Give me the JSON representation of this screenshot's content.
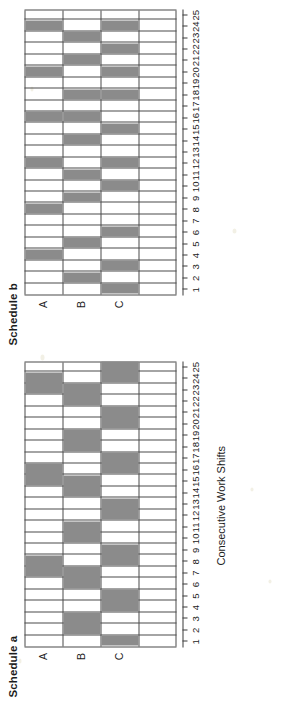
{
  "figure": {
    "axis_title": "Consecutive Work Shifts",
    "row_labels": [
      "A",
      "B",
      "C"
    ],
    "tick_labels": [
      "1",
      "2",
      "3",
      "4",
      "5",
      "6",
      "7",
      "8",
      "9",
      "10",
      "11",
      "12",
      "13",
      "14",
      "15",
      "16",
      "17",
      "18",
      "19",
      "20",
      "21",
      "22",
      "23",
      "24",
      "25"
    ],
    "fill_color": "#8b8b8b",
    "line_color": "#4a4a4a",
    "background_color": "#ffffff"
  },
  "panels": [
    {
      "id": "a",
      "title": "Schedule a"
    },
    {
      "id": "b",
      "title": "Schedule b"
    }
  ],
  "chart_data": {
    "type": "heatmap",
    "title": "",
    "xlabel": "Consecutive Work Shifts",
    "ylabel": "",
    "xlim": [
      0.5,
      25.5
    ],
    "grid": true,
    "legend": "none",
    "charts": [
      {
        "name": "Schedule a",
        "description": "Crew assignment grid: shaded block means the crew works that shift. Blocks are 2 shifts long.",
        "rows": [
          "A",
          "B",
          "C"
        ],
        "categories": [
          "1",
          "2",
          "3",
          "4",
          "5",
          "6",
          "7",
          "8",
          "9",
          "10",
          "11",
          "12",
          "13",
          "14",
          "15",
          "16",
          "17",
          "18",
          "19",
          "20",
          "21",
          "22",
          "23",
          "24",
          "25"
        ],
        "blocks": [
          {
            "row": "C",
            "start": 1,
            "end": 2
          },
          {
            "row": "B",
            "start": 2,
            "end": 4
          },
          {
            "row": "C",
            "start": 4,
            "end": 6
          },
          {
            "row": "B",
            "start": 6,
            "end": 8
          },
          {
            "row": "A",
            "start": 7,
            "end": 9
          },
          {
            "row": "C",
            "start": 8,
            "end": 10
          },
          {
            "row": "B",
            "start": 10,
            "end": 12
          },
          {
            "row": "C",
            "start": 12,
            "end": 14
          },
          {
            "row": "B",
            "start": 14,
            "end": 16
          },
          {
            "row": "A",
            "start": 15,
            "end": 17
          },
          {
            "row": "C",
            "start": 16,
            "end": 18
          },
          {
            "row": "B",
            "start": 18,
            "end": 20
          },
          {
            "row": "C",
            "start": 20,
            "end": 22
          },
          {
            "row": "B",
            "start": 22,
            "end": 24
          },
          {
            "row": "A",
            "start": 23,
            "end": 25
          },
          {
            "row": "C",
            "start": 24,
            "end": 26
          }
        ],
        "series": [
          {
            "name": "A",
            "values": [
              0,
              0,
              0,
              0,
              0,
              0,
              1,
              1,
              0,
              0,
              0,
              0,
              0,
              0,
              1,
              1,
              0,
              0,
              0,
              0,
              0,
              0,
              1,
              1,
              0
            ]
          },
          {
            "name": "B",
            "values": [
              0,
              1,
              1,
              0,
              0,
              1,
              1,
              0,
              0,
              1,
              1,
              0,
              0,
              1,
              1,
              0,
              0,
              1,
              1,
              0,
              0,
              1,
              1,
              0,
              0
            ]
          },
          {
            "name": "C",
            "values": [
              1,
              0,
              0,
              1,
              1,
              0,
              0,
              1,
              1,
              0,
              0,
              1,
              1,
              0,
              0,
              1,
              1,
              0,
              0,
              1,
              1,
              0,
              0,
              1,
              1
            ]
          }
        ]
      },
      {
        "name": "Schedule b",
        "description": "Crew assignment grid: shaded block means the crew works that shift. Blocks are 1 shift long.",
        "rows": [
          "A",
          "B",
          "C"
        ],
        "categories": [
          "1",
          "2",
          "3",
          "4",
          "5",
          "6",
          "7",
          "8",
          "9",
          "10",
          "11",
          "12",
          "13",
          "14",
          "15",
          "16",
          "17",
          "18",
          "19",
          "20",
          "21",
          "22",
          "23",
          "24",
          "25"
        ],
        "blocks": [
          {
            "row": "C",
            "start": 1,
            "end": 2
          },
          {
            "row": "B",
            "start": 2,
            "end": 3
          },
          {
            "row": "C",
            "start": 3,
            "end": 4
          },
          {
            "row": "A",
            "start": 4,
            "end": 5
          },
          {
            "row": "B",
            "start": 5,
            "end": 6
          },
          {
            "row": "C",
            "start": 6,
            "end": 7
          },
          {
            "row": "A",
            "start": 8,
            "end": 9
          },
          {
            "row": "B",
            "start": 9,
            "end": 10
          },
          {
            "row": "C",
            "start": 10,
            "end": 11
          },
          {
            "row": "B",
            "start": 11,
            "end": 12
          },
          {
            "row": "C",
            "start": 12,
            "end": 13
          },
          {
            "row": "A",
            "start": 12,
            "end": 13
          },
          {
            "row": "B",
            "start": 14,
            "end": 15
          },
          {
            "row": "C",
            "start": 15,
            "end": 16
          },
          {
            "row": "A",
            "start": 16,
            "end": 17
          },
          {
            "row": "B",
            "start": 16,
            "end": 17
          },
          {
            "row": "C",
            "start": 18,
            "end": 19
          },
          {
            "row": "B",
            "start": 18,
            "end": 19
          },
          {
            "row": "A",
            "start": 20,
            "end": 21
          },
          {
            "row": "C",
            "start": 20,
            "end": 21
          },
          {
            "row": "B",
            "start": 21,
            "end": 22
          },
          {
            "row": "C",
            "start": 22,
            "end": 23
          },
          {
            "row": "B",
            "start": 23,
            "end": 24
          },
          {
            "row": "A",
            "start": 24,
            "end": 25
          },
          {
            "row": "C",
            "start": 24,
            "end": 25
          }
        ],
        "series": [
          {
            "name": "A",
            "values": [
              0,
              0,
              0,
              1,
              0,
              0,
              0,
              1,
              0,
              0,
              0,
              1,
              0,
              0,
              0,
              1,
              0,
              0,
              0,
              1,
              0,
              0,
              0,
              1,
              0
            ]
          },
          {
            "name": "B",
            "values": [
              0,
              1,
              0,
              0,
              1,
              0,
              0,
              0,
              1,
              0,
              1,
              0,
              0,
              1,
              0,
              1,
              0,
              1,
              0,
              0,
              1,
              0,
              1,
              0,
              0
            ]
          },
          {
            "name": "C",
            "values": [
              1,
              0,
              1,
              0,
              0,
              1,
              0,
              0,
              0,
              1,
              0,
              1,
              0,
              0,
              1,
              0,
              0,
              1,
              0,
              1,
              0,
              1,
              0,
              1,
              0
            ]
          }
        ]
      }
    ]
  }
}
